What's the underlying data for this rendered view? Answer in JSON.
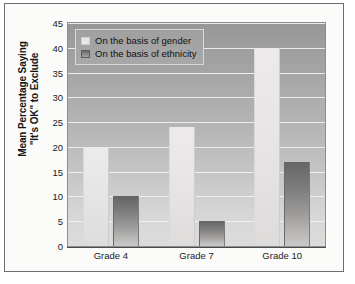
{
  "chart_data": {
    "type": "bar",
    "title": "",
    "subtitle": "",
    "xlabel": "",
    "ylabel_line1": "Mean Percentage Saying",
    "ylabel_line2": "\"It's OK\" to Exclude",
    "categories": [
      "Grade 4",
      "Grade 7",
      "Grade 10"
    ],
    "series": [
      {
        "name": "On the basis of gender",
        "values": [
          20,
          24,
          40
        ],
        "color": "#e8e6e5"
      },
      {
        "name": "On the basis of ethnicity",
        "values": [
          10,
          5,
          17
        ],
        "color": "#7c7b7b"
      }
    ],
    "ylim": [
      0,
      45
    ],
    "ytick_values": [
      0,
      5,
      10,
      15,
      20,
      25,
      30,
      35,
      40,
      45
    ],
    "ytick_labels": [
      "0",
      "5",
      "10",
      "15",
      "20",
      "25",
      "30",
      "35",
      "40",
      "45"
    ],
    "grid": true,
    "grid_color": "#f2f2f2",
    "legend_position": "top-left",
    "plot_background": "gray-vertical-gradient",
    "frame_border_color": "#6e6e6e",
    "figure_background": "#fbfbfa"
  }
}
